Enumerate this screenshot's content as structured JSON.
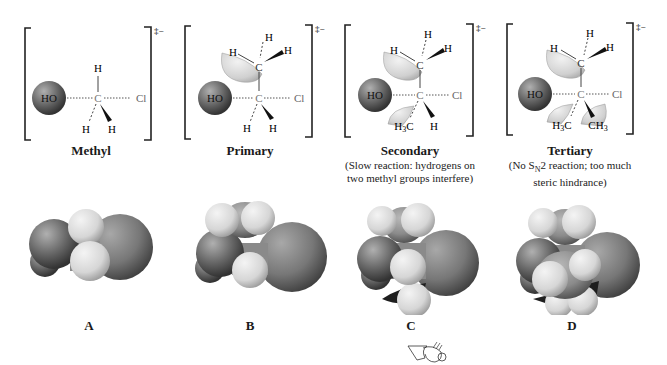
{
  "figure": {
    "charge_symbol": "‡−",
    "atoms": {
      "nucleophile": "HO",
      "carbon": "C",
      "leaving_group": "Cl",
      "hydrogen": "H",
      "methyl_left": "H3C",
      "methyl_right": "CH3"
    },
    "panels": [
      {
        "title": "Methyl",
        "note_line1": "",
        "note_line2": "",
        "model_label": "A"
      },
      {
        "title": "Primary",
        "note_line1": "",
        "note_line2": "",
        "model_label": "B"
      },
      {
        "title": "Secondary",
        "note_line1": "(Slow reaction: hydrogens on",
        "note_line2": "two methyl groups interfere)",
        "model_label": "C"
      },
      {
        "title": "Tertiary",
        "note_line1": "(No SN2 reaction; too much",
        "note_line2": "steric hindrance)",
        "model_label": "D"
      }
    ],
    "colors": {
      "oxygen_sphere": "#6f6f6f",
      "chlorine_sphere": "#7a7a7a",
      "carbon_sphere": "#8a8a8a",
      "hydrogen_sphere": "#d9d9d9",
      "lobe": "#d4d4d4",
      "line": "#333333"
    }
  }
}
